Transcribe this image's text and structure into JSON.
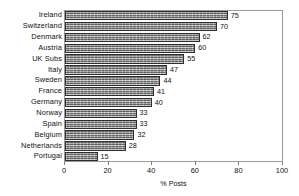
{
  "chart_data": {
    "type": "bar",
    "orientation": "horizontal",
    "title": "",
    "subtitle": "",
    "xlabel": "% Posts",
    "ylabel": "",
    "xlim": [
      0,
      100
    ],
    "ylim": null,
    "grid": false,
    "legend": null,
    "xticks": [
      0,
      20,
      40,
      60,
      80,
      100
    ],
    "xtick_labels": [
      "0",
      "20",
      "40",
      "60",
      "80",
      "100"
    ],
    "categories": [
      "Ireland",
      "Switzerland",
      "Denmark",
      "Austria",
      "UK Subs",
      "Italy",
      "Sweden",
      "France",
      "Germany",
      "Norway",
      "Spain",
      "Belgium",
      "Netherlands",
      "Portugal"
    ],
    "values": [
      75,
      70,
      62,
      60,
      55,
      47,
      44,
      41,
      40,
      33,
      33,
      32,
      28,
      15
    ],
    "value_labels": [
      "75",
      "70",
      "62",
      "60",
      "55",
      "47",
      "44",
      "41",
      "40",
      "33",
      "33",
      "32",
      "28",
      "15"
    ],
    "series": [
      {
        "name": "% Posts",
        "values": [
          75,
          70,
          62,
          60,
          55,
          47,
          44,
          41,
          40,
          33,
          33,
          32,
          28,
          15
        ]
      }
    ],
    "colors": {
      "bar_fill": "#8c8c8c",
      "bar_border": "#2e2e2e",
      "frame": "#9a9a9a",
      "text": "#111111",
      "background": "#ffffff"
    }
  }
}
